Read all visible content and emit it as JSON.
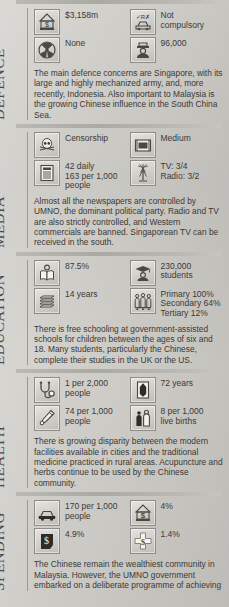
{
  "sections": [
    {
      "label": "DEFENCE",
      "stats": [
        {
          "icon": "military-budget-icon",
          "value": "$3,158m"
        },
        {
          "icon": "conscription-vehicle-icon",
          "value": "Not\ncompulsory"
        },
        {
          "icon": "nuclear-weapons-icon",
          "value": "None"
        },
        {
          "icon": "armed-forces-personnel-icon",
          "value": "96,000"
        }
      ],
      "paragraph": "The main defence concerns are Singapore, with its large and highly mechanized army, and, more recently, Indonesia. Also important to Malaysia is the growing Chinese influence in the South China Sea."
    },
    {
      "label": "MEDIA",
      "stats": [
        {
          "icon": "censorship-skull-icon",
          "value": "Censorship"
        },
        {
          "icon": "television-icon",
          "value": "Medium"
        },
        {
          "icon": "newspaper-icon",
          "value": "42 daily\n163 per 1,000\npeople"
        },
        {
          "icon": "broadcast-tower-icon",
          "value": "TV: 3/4\nRadio: 3/2"
        }
      ],
      "paragraph": "Almost all the newspapers are controlled by UMNO, the dominant political party. Radio and TV are also strictly controlled, and Western commercials are banned. Singaporean TV can be received in the south."
    },
    {
      "label": "EDUCATION",
      "stats": [
        {
          "icon": "literacy-reader-icon",
          "value": "87.5%"
        },
        {
          "icon": "graduate-icon",
          "value": "230,000\nstudents"
        },
        {
          "icon": "books-icon",
          "value": "14 years"
        },
        {
          "icon": "pupils-group-icon",
          "value": "Primary 100%\nSecondary 64%\nTertiary 12%"
        }
      ],
      "paragraph": "There is free schooling at government-assisted schools for children between the ages of six and 18. Many students, particularly the Chinese, complete their studies in the UK or the US."
    },
    {
      "label": "HEALTH",
      "stats": [
        {
          "icon": "stethoscope-icon",
          "value": "1 per 2,000\npeople"
        },
        {
          "icon": "life-expectancy-coffin-icon",
          "value": "72 years"
        },
        {
          "icon": "medicine-bottle-icon",
          "value": "74 per 1,000\npeople"
        },
        {
          "icon": "infant-mortality-icon",
          "value": "8 per 1,000\nlive births"
        }
      ],
      "paragraph": "There is growing disparity between the modern facilities available in cities and the traditional medicine practiced in rural areas. Acupuncture and herbs continue to be used by the Chinese community."
    },
    {
      "label": "SPENDING",
      "stats": [
        {
          "icon": "car-ownership-icon",
          "value": "170 per 1,000\npeople"
        },
        {
          "icon": "defence-spending-icon",
          "value": "4%"
        },
        {
          "icon": "education-spending-icon",
          "value": "4.9%"
        },
        {
          "icon": "health-spending-icon",
          "value": "1.4%"
        }
      ],
      "paragraph": "The Chinese remain the wealthiest community in Malaysia. However, the UMNO government embarked on a deliberate programme of achieving"
    }
  ],
  "colors": {
    "page_background": "#cfcdc8",
    "text": "#3b3936",
    "label_text": "#4c4a48",
    "rule": "#a9a7a2",
    "icon_border": "#8e8c88"
  }
}
